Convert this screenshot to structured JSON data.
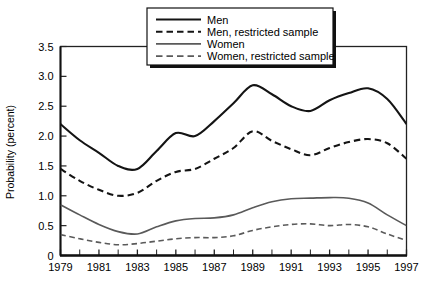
{
  "chart_data": {
    "type": "line",
    "title": "",
    "xlabel": "",
    "ylabel": "Probability (percent)",
    "xlim": [
      1979,
      1997
    ],
    "ylim": [
      0,
      3.5
    ],
    "ytick_labels": [
      "0",
      "0.5",
      "1.0",
      "1.5",
      "2.0",
      "2.5",
      "3.0",
      "3.5"
    ],
    "ytick_values": [
      0,
      0.5,
      1.0,
      1.5,
      2.0,
      2.5,
      3.0,
      3.5
    ],
    "xtick_labels": [
      "1979",
      "1981",
      "1983",
      "1985",
      "1987",
      "1989",
      "1991",
      "1993",
      "1995",
      "1997"
    ],
    "xtick_values": [
      1979,
      1981,
      1983,
      1985,
      1987,
      1989,
      1991,
      1993,
      1995,
      1997
    ],
    "minor_ticks": "yearly",
    "grid": false,
    "legend_position": "top-center",
    "x": [
      1979,
      1980,
      1981,
      1982,
      1983,
      1984,
      1985,
      1986,
      1987,
      1988,
      1989,
      1990,
      1991,
      1992,
      1993,
      1994,
      1995,
      1996,
      1997
    ],
    "series": [
      {
        "name": "Men",
        "style": "solid",
        "color": "#141414",
        "width": 2.1,
        "values": [
          2.2,
          1.93,
          1.72,
          1.5,
          1.45,
          1.75,
          2.05,
          2.0,
          2.25,
          2.55,
          2.85,
          2.7,
          2.5,
          2.42,
          2.6,
          2.72,
          2.8,
          2.62,
          2.2
        ]
      },
      {
        "name": "Men, restricted sample",
        "style": "dashed",
        "color": "#141414",
        "width": 2.1,
        "values": [
          1.45,
          1.25,
          1.1,
          1.0,
          1.05,
          1.25,
          1.4,
          1.45,
          1.62,
          1.8,
          2.08,
          1.92,
          1.78,
          1.68,
          1.8,
          1.9,
          1.95,
          1.88,
          1.62
        ]
      },
      {
        "name": "Women",
        "style": "solid",
        "color": "#5a5a5a",
        "width": 1.6,
        "values": [
          0.85,
          0.68,
          0.52,
          0.4,
          0.36,
          0.48,
          0.58,
          0.62,
          0.63,
          0.68,
          0.8,
          0.9,
          0.95,
          0.96,
          0.97,
          0.96,
          0.88,
          0.68,
          0.5
        ]
      },
      {
        "name": "Women, restricted sample",
        "style": "dashed",
        "color": "#5a5a5a",
        "width": 1.6,
        "values": [
          0.35,
          0.28,
          0.22,
          0.18,
          0.2,
          0.24,
          0.28,
          0.3,
          0.3,
          0.33,
          0.42,
          0.48,
          0.52,
          0.53,
          0.5,
          0.52,
          0.48,
          0.36,
          0.25
        ]
      }
    ],
    "legend_entries": [
      {
        "label": "Men",
        "style": "solid",
        "color": "#141414"
      },
      {
        "label": "Men, restricted sample",
        "style": "dashed",
        "color": "#141414"
      },
      {
        "label": "Women",
        "style": "solid",
        "color": "#5a5a5a"
      },
      {
        "label": "Women, restricted sample",
        "style": "dashed",
        "color": "#5a5a5a"
      }
    ]
  }
}
